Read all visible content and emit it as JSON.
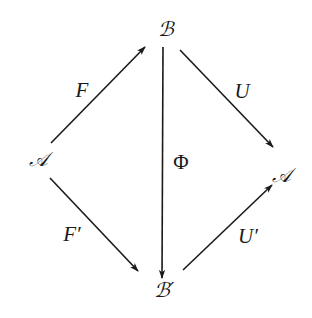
{
  "diagram": {
    "type": "commutative-diagram",
    "nodes": [
      {
        "id": "A_left",
        "label": "𝒜",
        "x": 38,
        "y": 160
      },
      {
        "id": "B_top",
        "label": "ℬ",
        "x": 166,
        "y": 30
      },
      {
        "id": "A_right",
        "label": "𝒜",
        "x": 281,
        "y": 175
      },
      {
        "id": "B_bottom",
        "label": "ℬ′",
        "x": 164,
        "y": 291
      }
    ],
    "edges": [
      {
        "id": "F",
        "from": "A_left",
        "to": "B_top",
        "label": "F"
      },
      {
        "id": "U",
        "from": "B_top",
        "to": "A_right",
        "label": "U"
      },
      {
        "id": "Phi",
        "from": "B_top",
        "to": "B_bottom",
        "label": "Φ"
      },
      {
        "id": "F_prime",
        "from": "A_left",
        "to": "B_bottom",
        "label": "F′"
      },
      {
        "id": "U_prime",
        "from": "B_bottom",
        "to": "A_right",
        "label": "U′"
      }
    ]
  }
}
